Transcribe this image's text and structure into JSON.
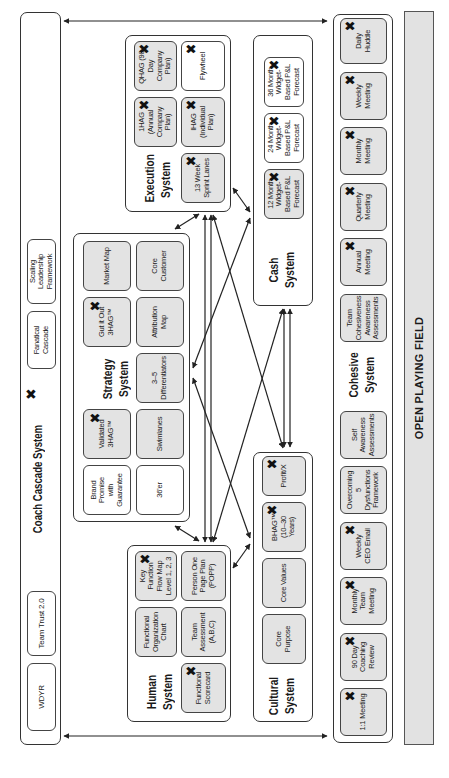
{
  "coach_cascade": {
    "title": "Coach Cascade System",
    "items": [
      "WDYR",
      "Team Trust 2.0",
      "Fanatical Cascade",
      "Scaling Leadership Framework"
    ]
  },
  "human_system": {
    "title": "Human\nSystem",
    "cards": [
      "Functional Scorecard",
      "Functional Organization Chart",
      "Team Assessment (A,B,C)",
      "Key Function Flow Map Level 1, 2, 3",
      "Person One Page Plan (POPP)"
    ]
  },
  "strategy_system": {
    "title": "Strategy\nSystem",
    "cards": [
      "Brand Promise with Guarantee",
      "36'er",
      "Validated 3HAG™",
      "Swimlanes",
      "3–5 Differentiators",
      "Gut it Out 3HAG™",
      "Attribution Map",
      "Market Map",
      "Core Customer"
    ]
  },
  "execution_system": {
    "title": "Execution\nSystem",
    "cards": [
      "13 Week Sprint Lanes",
      "1HAG (Annual Company Plan)",
      "IHAG (Individual Plan)",
      "QHAG (90-Day Company Plan)",
      "Flywheel"
    ]
  },
  "cultural_system": {
    "title": "Cultural\nSystem",
    "cards": [
      "Core Purpose",
      "Core Values",
      "BHAG™ (10–30 Years)",
      "Profit/X"
    ]
  },
  "cash_system": {
    "title": "Cash\nSystem",
    "cards": [
      "12 Month Widget-Based P&L Forecast",
      "24 Month Widget-Based P&L Forecast",
      "36 Month Widget-Based P&L Forecast"
    ]
  },
  "cohesive_system": {
    "title": "Cohesive\nSystem",
    "cards": [
      "1:1 Meeting",
      "90 Day Coaching Review",
      "Monthly Team Meeting",
      "Weekly CEO Email",
      "Overcoming 5 Dysfunctions Framework",
      "Self Awareness Assessments",
      "Team Cohesiveness Awareness Assessments",
      "Annual Meeting",
      "Quarterly Meeting",
      "Monthly Meeting",
      "Weekly Meeting",
      "Daily Huddle"
    ]
  },
  "open_playing_field": {
    "label": "OPEN PLAYING FIELD"
  },
  "marks": {
    "x": "✖"
  },
  "colors": {
    "card_gray": "#e3e3e3",
    "field_gray": "#e2e2e2",
    "line": "#333333"
  }
}
